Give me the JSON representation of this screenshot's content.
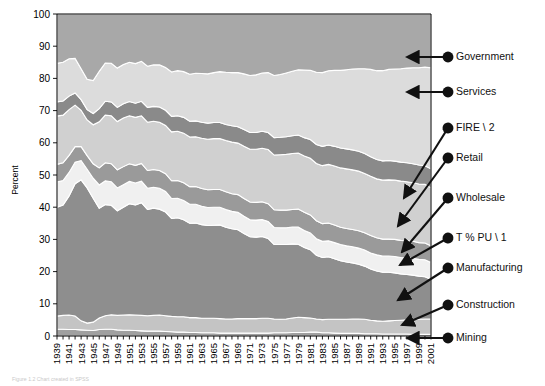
{
  "figure": {
    "caption": "Figure 1.2  Chart created in SPSS",
    "width": 545,
    "height": 386
  },
  "chart_data": {
    "type": "area",
    "stacked": true,
    "title": "",
    "subtitle": "",
    "xlabel": "",
    "ylabel": "Percent",
    "ylim": [
      0,
      100
    ],
    "xlim": [
      1939,
      2001
    ],
    "grid": false,
    "legend_position": "right-callouts",
    "ytick_labels": [
      "0",
      "10",
      "20",
      "30",
      "40",
      "50",
      "60",
      "70",
      "80",
      "90",
      "100"
    ],
    "ytick_values": [
      0,
      10,
      20,
      30,
      40,
      50,
      60,
      70,
      80,
      90,
      100
    ],
    "xtick_labels": [
      "1939",
      "1941",
      "1943",
      "1945",
      "1947",
      "1949",
      "1951",
      "1953",
      "1955",
      "1957",
      "1959",
      "1961",
      "1963",
      "1965",
      "1967",
      "1969",
      "1971",
      "1973",
      "1975",
      "1977",
      "1979",
      "1981",
      "1983",
      "1985",
      "1987",
      "1989",
      "1991",
      "1993",
      "1995",
      "1997",
      "1999",
      "2001"
    ],
    "x": [
      1939,
      1940,
      1941,
      1942,
      1943,
      1944,
      1945,
      1946,
      1947,
      1948,
      1949,
      1950,
      1951,
      1952,
      1953,
      1954,
      1955,
      1956,
      1957,
      1958,
      1959,
      1960,
      1961,
      1962,
      1963,
      1964,
      1965,
      1966,
      1967,
      1968,
      1969,
      1970,
      1971,
      1972,
      1973,
      1974,
      1975,
      1976,
      1977,
      1978,
      1979,
      1980,
      1981,
      1982,
      1983,
      1984,
      1985,
      1986,
      1987,
      1988,
      1989,
      1990,
      1991,
      1992,
      1993,
      1994,
      1995,
      1996,
      1997,
      1998,
      1999,
      2000,
      2001
    ],
    "series": [
      {
        "name": "Mining",
        "color": "#a0a0a0",
        "values": [
          2.1,
          2.1,
          2.0,
          2.0,
          1.9,
          1.8,
          1.7,
          2.0,
          2.1,
          2.1,
          1.9,
          1.8,
          1.8,
          1.7,
          1.6,
          1.5,
          1.5,
          1.5,
          1.4,
          1.3,
          1.2,
          1.2,
          1.1,
          1.1,
          1.0,
          1.0,
          1.0,
          0.9,
          0.9,
          0.9,
          0.9,
          0.9,
          0.9,
          0.9,
          0.9,
          0.9,
          1.0,
          1.0,
          1.0,
          1.1,
          1.1,
          1.1,
          1.2,
          1.2,
          1.0,
          1.0,
          0.9,
          0.8,
          0.8,
          0.8,
          0.8,
          0.7,
          0.7,
          0.7,
          0.6,
          0.6,
          0.6,
          0.6,
          0.6,
          0.5,
          0.5,
          0.5,
          0.5
        ]
      },
      {
        "name": "Construction",
        "color": "#c4c4c4",
        "values": [
          4.1,
          4.3,
          4.5,
          4.2,
          2.8,
          2.2,
          2.6,
          3.6,
          4.2,
          4.5,
          4.5,
          4.7,
          4.8,
          4.8,
          4.8,
          4.8,
          4.9,
          5.0,
          4.9,
          4.8,
          4.8,
          4.8,
          4.6,
          4.6,
          4.5,
          4.5,
          4.5,
          4.5,
          4.4,
          4.4,
          4.5,
          4.5,
          4.5,
          4.5,
          4.6,
          4.6,
          4.3,
          4.2,
          4.3,
          4.5,
          4.7,
          4.6,
          4.4,
          4.1,
          4.1,
          4.2,
          4.3,
          4.4,
          4.4,
          4.5,
          4.5,
          4.5,
          4.2,
          4.0,
          4.0,
          4.1,
          4.2,
          4.3,
          4.4,
          4.6,
          4.7,
          4.8,
          4.8
        ]
      },
      {
        "name": "Manufacturing",
        "color": "#8e8e8e",
        "values": [
          33.8,
          34.3,
          37.0,
          41.1,
          43.8,
          42.0,
          38.5,
          34.1,
          34.5,
          34.0,
          32.5,
          33.5,
          34.5,
          34.2,
          35.0,
          33.0,
          33.3,
          32.9,
          32.2,
          30.4,
          30.7,
          30.1,
          29.3,
          29.4,
          29.1,
          28.8,
          28.9,
          29.1,
          28.5,
          28.0,
          27.6,
          26.4,
          25.4,
          25.3,
          25.4,
          24.8,
          23.1,
          23.2,
          23.1,
          23.0,
          22.7,
          21.8,
          21.2,
          19.8,
          19.3,
          19.4,
          18.8,
          18.2,
          17.8,
          17.4,
          17.0,
          16.5,
          15.9,
          15.5,
          15.2,
          15.1,
          14.8,
          14.4,
          14.1,
          13.8,
          13.4,
          13.1,
          12.3
        ]
      },
      {
        "name": "T % PU \\ 1",
        "color": "#f0f0f0",
        "values": [
          7.8,
          7.6,
          7.3,
          6.7,
          6.0,
          5.8,
          6.2,
          7.2,
          7.4,
          7.3,
          7.1,
          7.0,
          6.9,
          6.8,
          6.7,
          6.6,
          6.5,
          6.5,
          6.4,
          6.2,
          6.1,
          6.0,
          5.9,
          5.8,
          5.7,
          5.6,
          5.6,
          5.5,
          5.5,
          5.4,
          5.4,
          5.4,
          5.3,
          5.3,
          5.3,
          5.3,
          5.3,
          5.2,
          5.2,
          5.2,
          5.3,
          5.3,
          5.2,
          5.1,
          5.0,
          5.0,
          5.0,
          5.0,
          5.0,
          5.0,
          5.0,
          5.0,
          5.0,
          5.0,
          5.0,
          5.0,
          5.1,
          5.1,
          5.2,
          5.2,
          5.2,
          5.3,
          5.2
        ]
      },
      {
        "name": "Wholesale",
        "color": "#9a9a9a",
        "values": [
          5.5,
          5.5,
          5.3,
          4.8,
          4.3,
          4.2,
          4.5,
          5.3,
          5.6,
          5.6,
          5.6,
          5.6,
          5.5,
          5.5,
          5.5,
          5.5,
          5.5,
          5.5,
          5.5,
          5.5,
          5.5,
          5.5,
          5.5,
          5.5,
          5.5,
          5.5,
          5.5,
          5.5,
          5.5,
          5.5,
          5.5,
          5.5,
          5.5,
          5.5,
          5.5,
          5.5,
          5.5,
          5.5,
          5.5,
          5.5,
          5.6,
          5.6,
          5.6,
          5.6,
          5.5,
          5.5,
          5.5,
          5.4,
          5.4,
          5.4,
          5.4,
          5.4,
          5.4,
          5.3,
          5.3,
          5.3,
          5.3,
          5.3,
          5.3,
          5.3,
          5.2,
          5.2,
          5.2
        ]
      },
      {
        "name": "Retail",
        "color": "#d0d0d0",
        "values": [
          15.0,
          14.8,
          14.2,
          12.9,
          11.3,
          11.1,
          12.1,
          14.3,
          14.8,
          14.9,
          15.0,
          15.1,
          14.9,
          14.9,
          14.8,
          15.0,
          15.0,
          15.0,
          15.0,
          15.2,
          15.3,
          15.4,
          15.4,
          15.5,
          15.6,
          15.7,
          15.8,
          15.8,
          15.9,
          16.0,
          16.0,
          16.2,
          16.4,
          16.5,
          16.6,
          16.8,
          17.0,
          17.2,
          17.3,
          17.4,
          17.4,
          17.5,
          17.6,
          17.8,
          18.0,
          18.2,
          18.3,
          18.4,
          18.5,
          18.5,
          18.5,
          18.4,
          18.4,
          18.3,
          18.3,
          18.4,
          18.4,
          18.4,
          18.3,
          18.2,
          18.2,
          18.2,
          18.0
        ]
      },
      {
        "name": "FIRE \\ 2",
        "color": "#8a8a8a",
        "values": [
          4.4,
          4.4,
          4.2,
          3.8,
          3.3,
          3.2,
          3.5,
          4.1,
          4.3,
          4.3,
          4.4,
          4.4,
          4.4,
          4.4,
          4.5,
          4.6,
          4.6,
          4.7,
          4.7,
          4.8,
          4.8,
          4.9,
          4.9,
          4.9,
          5.0,
          5.0,
          5.0,
          5.0,
          5.0,
          5.1,
          5.1,
          5.2,
          5.2,
          5.2,
          5.3,
          5.3,
          5.4,
          5.4,
          5.5,
          5.5,
          5.6,
          5.7,
          5.8,
          5.9,
          6.0,
          6.0,
          6.1,
          6.2,
          6.2,
          6.2,
          6.2,
          6.2,
          6.1,
          6.0,
          6.0,
          6.0,
          5.9,
          5.9,
          5.9,
          5.9,
          5.9,
          5.8,
          5.9
        ]
      },
      {
        "name": "Services",
        "color": "#dcdcdc",
        "values": [
          12.0,
          12.0,
          11.6,
          10.7,
          9.6,
          9.4,
          10.2,
          11.6,
          11.9,
          12.0,
          12.2,
          12.2,
          12.2,
          12.3,
          12.4,
          12.8,
          12.9,
          13.1,
          13.3,
          13.8,
          14.0,
          14.2,
          14.6,
          14.8,
          15.1,
          15.3,
          15.5,
          15.8,
          16.2,
          16.5,
          16.8,
          17.3,
          17.7,
          17.9,
          18.1,
          18.6,
          19.3,
          19.5,
          19.8,
          20.0,
          20.3,
          21.0,
          21.5,
          22.4,
          22.9,
          23.1,
          23.6,
          24.1,
          24.6,
          25.1,
          25.6,
          26.3,
          27.1,
          27.6,
          28.0,
          28.3,
          28.6,
          29.0,
          29.4,
          29.8,
          30.2,
          30.6,
          31.4
        ]
      },
      {
        "name": "Government",
        "color": "#a8a8a8",
        "values": [
          15.3,
          15.0,
          13.9,
          13.8,
          17.0,
          20.3,
          20.7,
          17.8,
          15.2,
          15.3,
          16.8,
          15.7,
          15.0,
          15.4,
          14.7,
          16.2,
          15.8,
          15.8,
          16.6,
          18.0,
          17.6,
          17.9,
          18.7,
          18.4,
          18.5,
          18.6,
          18.2,
          17.9,
          18.1,
          18.2,
          18.2,
          18.6,
          19.1,
          18.9,
          18.3,
          18.2,
          19.1,
          18.8,
          18.3,
          17.8,
          17.3,
          17.4,
          17.5,
          18.1,
          18.2,
          17.6,
          17.5,
          17.5,
          17.3,
          17.1,
          17.0,
          17.0,
          17.2,
          17.6,
          17.6,
          17.2,
          17.1,
          17.0,
          16.8,
          16.7,
          16.7,
          16.5,
          16.7
        ]
      }
    ],
    "annotations": [
      {
        "label": "Government",
        "style": "horizontal"
      },
      {
        "label": "Services",
        "style": "horizontal"
      },
      {
        "label": "FIRE \\ 2",
        "style": "diagonal"
      },
      {
        "label": "Retail",
        "style": "diagonal"
      },
      {
        "label": "Wholesale",
        "style": "diagonal"
      },
      {
        "label": "T % PU \\ 1",
        "style": "diagonal"
      },
      {
        "label": "Manufacturing",
        "style": "diagonal"
      },
      {
        "label": "Construction",
        "style": "diagonal"
      },
      {
        "label": "Mining",
        "style": "horizontal"
      }
    ]
  }
}
